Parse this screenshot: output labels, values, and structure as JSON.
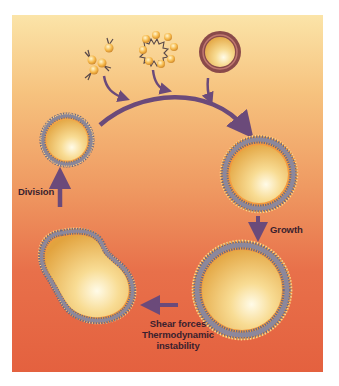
{
  "diagram": {
    "type": "cycle",
    "title": "",
    "colors": {
      "background_top": "#fbe4a8",
      "background_bottom": "#e4613f",
      "arrow": "#6b4a7a",
      "membrane": "#6e6a80",
      "headgroup": "#f6b04a",
      "lumen": "#f3c770",
      "label": "#3a1f2e"
    },
    "inputs": [
      {
        "name": "amphiphile-monomers",
        "description": "Free amphiphile molecules"
      },
      {
        "name": "micelle",
        "description": "Micelle"
      },
      {
        "name": "preformed-vesicle",
        "description": "Preformed vesicle"
      }
    ],
    "stages": [
      {
        "name": "small-vesicle",
        "description": "Small vesicle"
      },
      {
        "name": "vesicle",
        "description": "Vesicle"
      },
      {
        "name": "large-vesicle",
        "description": "Grown vesicle"
      },
      {
        "name": "dividing-vesicle",
        "description": "Dividing vesicle"
      }
    ],
    "labels": {
      "growth": "Growth",
      "division": "Division",
      "shear_line1": "Shear forces",
      "shear_line2": "Thermodynamic",
      "shear_line3": "instability"
    }
  }
}
